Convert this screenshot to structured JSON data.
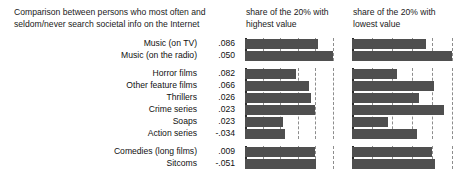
{
  "header": {
    "title": "Comparison between persons who most often and seldom/never search societal info on the Internet",
    "panel1_title": "share of the 20% with highest value",
    "panel2_title": "share of the 20% with lowest value"
  },
  "chart_data": {
    "type": "bar",
    "title": "Comparison between persons who most often and seldom/never search societal info on the Internet",
    "orientation": "horizontal",
    "xlabel": "",
    "ylabel": "",
    "grid": true,
    "legend": false,
    "panels": [
      {
        "name": "panel-highest",
        "title": "share of the 20% with highest value",
        "xlim": [
          0,
          1
        ],
        "gridlines": [
          0.2,
          0.4,
          0.6,
          0.8,
          1.0
        ]
      },
      {
        "name": "panel-lowest",
        "title": "share of the 20% with lowest value",
        "xlim": [
          0,
          1
        ],
        "gridlines": [
          0.2,
          0.4,
          0.6,
          0.8,
          1.0
        ]
      }
    ],
    "groups": [
      {
        "name": "music",
        "rows": [
          {
            "label": "Music (on TV)",
            "value": ".086",
            "numeric": 0.086,
            "highest": 0.83,
            "lowest": 0.74
          },
          {
            "label": "Music (on the radio)",
            "value": ".050",
            "numeric": 0.05,
            "highest": 1.0,
            "lowest": 1.0
          }
        ]
      },
      {
        "name": "films-and-series",
        "rows": [
          {
            "label": "Horror films",
            "value": ".082",
            "numeric": 0.082,
            "highest": 0.58,
            "lowest": 0.45
          },
          {
            "label": "Other feature films",
            "value": ".066",
            "numeric": 0.066,
            "highest": 0.73,
            "lowest": 0.82
          },
          {
            "label": "Thrillers",
            "value": ".026",
            "numeric": 0.026,
            "highest": 0.75,
            "lowest": 0.67
          },
          {
            "label": "Crime series",
            "value": ".023",
            "numeric": 0.023,
            "highest": 0.8,
            "lowest": 0.92
          },
          {
            "label": "Soaps",
            "value": ".023",
            "numeric": 0.023,
            "highest": 0.43,
            "lowest": 0.36
          },
          {
            "label": "Action series",
            "value": "-.034",
            "numeric": -0.034,
            "highest": 0.45,
            "lowest": 0.65
          }
        ]
      },
      {
        "name": "comedy",
        "rows": [
          {
            "label": "Comedies (long films)",
            "value": ".009",
            "numeric": 0.009,
            "highest": 0.79,
            "lowest": 0.8
          },
          {
            "label": "Sitcoms",
            "value": "-.051",
            "numeric": -0.051,
            "highest": 0.81,
            "lowest": 0.83
          }
        ]
      }
    ]
  },
  "colors": {
    "bar": "#4f4f4f",
    "axis": "#2b2b2b",
    "gridline": "#8d8d8d",
    "text": "#111111",
    "background": "#ffffff"
  }
}
